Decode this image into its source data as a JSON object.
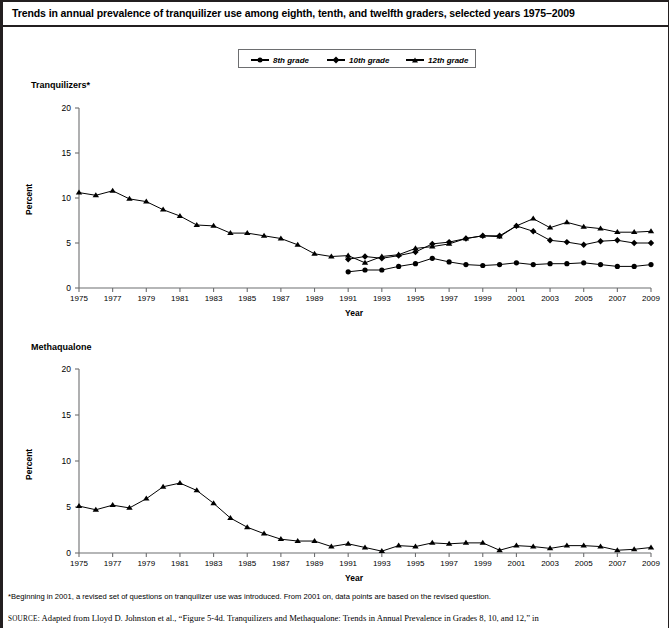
{
  "title": "Trends in annual prevalence of tranquilizer use among eighth, tenth, and twelfth graders, selected years 1975–2009",
  "legend": {
    "items": [
      {
        "label": "8th grade",
        "marker": "circle-marker"
      },
      {
        "label": "10th grade",
        "marker": "diamond-marker"
      },
      {
        "label": "12th grade",
        "marker": "triangle-marker"
      }
    ]
  },
  "footnote": "*Beginning in 2001, a revised set of questions on tranquilizer use was introduced. From 2001 on, data points are based on the revised question.",
  "source_prefix": "SOURCE",
  "source": ": Adapted from Lloyd D. Johnston et al., “Figure 5-4d. Tranquilizers and Methaqualone: Trends in Annual Prevalence in Grades 8, 10, and 12,” in",
  "axis": {
    "ylabel": "Percent",
    "xlabel": "Year",
    "yticks": [
      "0",
      "5",
      "10",
      "15",
      "20"
    ],
    "xticks": [
      "1975",
      "1977",
      "1979",
      "1981",
      "1983",
      "1985",
      "1987",
      "1989",
      "1991",
      "1993",
      "1995",
      "1997",
      "1999",
      "2001",
      "2003",
      "2005",
      "2007",
      "2009"
    ]
  },
  "chart_data": [
    {
      "type": "line",
      "title": "Tranquilizers*",
      "xlabel": "Year",
      "ylabel": "Percent",
      "ylim": [
        0,
        20
      ],
      "xlim": [
        1975,
        2009
      ],
      "yticks": [
        0,
        5,
        10,
        15,
        20
      ],
      "xticks": [
        1975,
        1977,
        1979,
        1981,
        1983,
        1985,
        1987,
        1989,
        1991,
        1993,
        1995,
        1997,
        1999,
        2001,
        2003,
        2005,
        2007,
        2009
      ],
      "grid": false,
      "legend_position": "top-center",
      "series": [
        {
          "name": "12th grade",
          "marker": "triangle",
          "x": [
            1975,
            1976,
            1977,
            1978,
            1979,
            1980,
            1981,
            1982,
            1983,
            1984,
            1985,
            1986,
            1987,
            1988,
            1989,
            1990,
            1991,
            1992,
            1993,
            1994,
            1995,
            1996,
            1997,
            1998,
            1999,
            2000,
            2001,
            2002,
            2003,
            2004,
            2005,
            2006,
            2007,
            2008,
            2009
          ],
          "values": [
            10.6,
            10.3,
            10.8,
            9.9,
            9.6,
            8.7,
            8.0,
            7.0,
            6.9,
            6.1,
            6.1,
            5.8,
            5.5,
            4.8,
            3.8,
            3.5,
            3.6,
            2.8,
            3.5,
            3.7,
            4.4,
            4.6,
            4.9,
            5.5,
            5.8,
            5.7,
            6.9,
            7.7,
            6.7,
            7.3,
            6.8,
            6.6,
            6.2,
            6.2,
            6.3
          ]
        },
        {
          "name": "10th grade",
          "marker": "diamond",
          "x": [
            1991,
            1992,
            1993,
            1994,
            1995,
            1996,
            1997,
            1998,
            1999,
            2000,
            2001,
            2002,
            2003,
            2004,
            2005,
            2006,
            2007,
            2008,
            2009
          ],
          "values": [
            3.2,
            3.5,
            3.3,
            3.6,
            4.0,
            4.9,
            5.1,
            5.5,
            5.8,
            5.8,
            6.9,
            6.3,
            5.3,
            5.1,
            4.8,
            5.2,
            5.3,
            5.0,
            5.0
          ]
        },
        {
          "name": "8th grade",
          "marker": "circle",
          "x": [
            1991,
            1992,
            1993,
            1994,
            1995,
            1996,
            1997,
            1998,
            1999,
            2000,
            2001,
            2002,
            2003,
            2004,
            2005,
            2006,
            2007,
            2008,
            2009
          ],
          "values": [
            1.8,
            2.0,
            2.0,
            2.4,
            2.7,
            3.3,
            2.9,
            2.6,
            2.5,
            2.6,
            2.8,
            2.6,
            2.7,
            2.7,
            2.8,
            2.6,
            2.4,
            2.4,
            2.6
          ]
        }
      ]
    },
    {
      "type": "line",
      "title": "Methaqualone",
      "xlabel": "Year",
      "ylabel": "Percent",
      "ylim": [
        0,
        20
      ],
      "xlim": [
        1975,
        2009
      ],
      "yticks": [
        0,
        5,
        10,
        15,
        20
      ],
      "xticks": [
        1975,
        1977,
        1979,
        1981,
        1983,
        1985,
        1987,
        1989,
        1991,
        1993,
        1995,
        1997,
        1999,
        2001,
        2003,
        2005,
        2007,
        2009
      ],
      "grid": false,
      "series": [
        {
          "name": "12th grade",
          "marker": "triangle",
          "x": [
            1975,
            1976,
            1977,
            1978,
            1979,
            1980,
            1981,
            1982,
            1983,
            1984,
            1985,
            1986,
            1987,
            1988,
            1989,
            1990,
            1991,
            1992,
            1993,
            1994,
            1995,
            1996,
            1997,
            1998,
            1999,
            2000,
            2001,
            2002,
            2003,
            2004,
            2005,
            2006,
            2007,
            2008,
            2009
          ],
          "values": [
            5.1,
            4.7,
            5.2,
            4.9,
            5.9,
            7.2,
            7.6,
            6.8,
            5.4,
            3.8,
            2.8,
            2.1,
            1.5,
            1.3,
            1.3,
            0.7,
            1.0,
            0.6,
            0.2,
            0.8,
            0.7,
            1.1,
            1.0,
            1.1,
            1.1,
            0.3,
            0.8,
            0.7,
            0.5,
            0.8,
            0.8,
            0.7,
            0.3,
            0.4,
            0.6
          ]
        }
      ]
    }
  ]
}
